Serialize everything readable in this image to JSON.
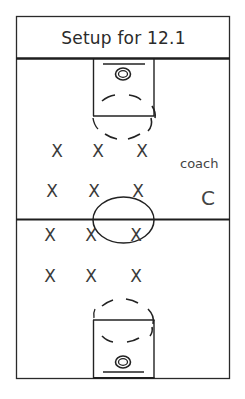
{
  "title": "Setup for 12.1",
  "colors": {
    "line": "#1e1e1e",
    "text": "#2b2b2b",
    "background": "#ffffff"
  },
  "players": {
    "marker": "X",
    "positions": [
      {
        "x": 57,
        "y": 151
      },
      {
        "x": 98,
        "y": 151
      },
      {
        "x": 142,
        "y": 151
      },
      {
        "x": 52,
        "y": 191
      },
      {
        "x": 94,
        "y": 191
      },
      {
        "x": 138,
        "y": 191
      },
      {
        "x": 50,
        "y": 235
      },
      {
        "x": 91,
        "y": 235
      },
      {
        "x": 136,
        "y": 235
      },
      {
        "x": 50,
        "y": 276
      },
      {
        "x": 91,
        "y": 276
      },
      {
        "x": 136,
        "y": 276
      }
    ]
  },
  "coach": {
    "label": "coach",
    "marker": "C"
  },
  "court": {
    "halfcourt_line": true,
    "center_circle": true,
    "baskets": [
      "top",
      "bottom"
    ]
  }
}
